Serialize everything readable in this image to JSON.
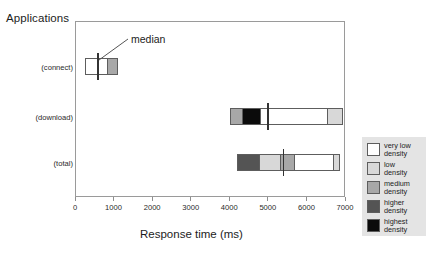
{
  "chart_data": {
    "type": "bar",
    "subtype": "stacked-horizontal-boxplot",
    "title": "Applications",
    "xlabel": "Response time (ms)",
    "ylabel": "",
    "xlim": [
      0,
      7000
    ],
    "xticks": [
      0,
      1000,
      2000,
      3000,
      4000,
      5000,
      6000,
      7000
    ],
    "xticklabels": [
      "0",
      "1000",
      "2000",
      "3000",
      "4000",
      "5000",
      "6000",
      "7000"
    ],
    "grid": false,
    "categories": [
      "(connect)",
      "(download)",
      "(total)"
    ],
    "legend_position": "right-outside",
    "legend_title": "",
    "series": [
      {
        "name": "very low density",
        "color": "#ffffff"
      },
      {
        "name": "low density",
        "color": "#d8d8d8"
      },
      {
        "name": "medium density",
        "color": "#a8a8a8"
      },
      {
        "name": "higher density",
        "color": "#545454"
      },
      {
        "name": "highest density",
        "color": "#0b0b0b"
      }
    ],
    "bars": [
      {
        "category": "(connect)",
        "start": 250,
        "end": 1120,
        "median": 590,
        "segments": [
          {
            "density": "very low density",
            "from": 250,
            "to": 830,
            "color": "#ffffff"
          },
          {
            "density": "medium density",
            "from": 830,
            "to": 1120,
            "color": "#a8a8a8"
          }
        ]
      },
      {
        "category": "(download)",
        "start": 4010,
        "end": 6950,
        "median": 5010,
        "segments": [
          {
            "density": "medium density",
            "from": 4010,
            "to": 4330,
            "color": "#a8a8a8"
          },
          {
            "density": "highest density",
            "from": 4330,
            "to": 4800,
            "color": "#0b0b0b"
          },
          {
            "density": "very low density",
            "from": 4800,
            "to": 6530,
            "color": "#ffffff"
          },
          {
            "density": "low density",
            "from": 6530,
            "to": 6950,
            "color": "#d8d8d8"
          }
        ]
      },
      {
        "category": "(total)",
        "start": 4200,
        "end": 6860,
        "median": 5410,
        "segments": [
          {
            "density": "higher density",
            "from": 4200,
            "to": 4770,
            "color": "#545454"
          },
          {
            "density": "low density",
            "from": 4770,
            "to": 5320,
            "color": "#d8d8d8"
          },
          {
            "density": "medium density",
            "from": 5320,
            "to": 5670,
            "color": "#a8a8a8"
          },
          {
            "density": "very low density",
            "from": 5670,
            "to": 6700,
            "color": "#ffffff"
          },
          {
            "density": "low density",
            "from": 6700,
            "to": 6860,
            "color": "#d8d8d8"
          }
        ]
      }
    ],
    "annotations": [
      {
        "text": "median",
        "points_to": "(connect) median line"
      }
    ]
  },
  "legend": {
    "items": [
      {
        "label": "very low\ndensity",
        "color": "#ffffff"
      },
      {
        "label": "low\ndensity",
        "color": "#d8d8d8"
      },
      {
        "label": "medium\ndensity",
        "color": "#a8a8a8"
      },
      {
        "label": "higher\ndensity",
        "color": "#545454"
      },
      {
        "label": "highest\ndensity",
        "color": "#0b0b0b"
      }
    ]
  }
}
